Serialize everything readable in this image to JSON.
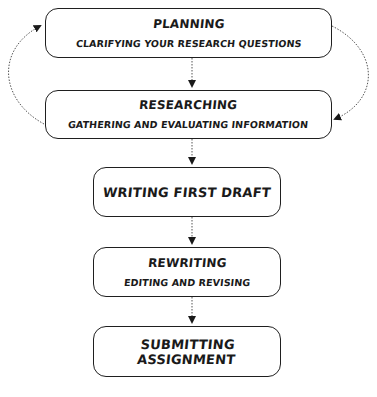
{
  "diagram": {
    "type": "flowchart",
    "steps": [
      {
        "id": "planning",
        "title": "PLANNING",
        "subtitle": "CLARIFYING YOUR RESEARCH QUESTIONS"
      },
      {
        "id": "researching",
        "title": "RESEARCHING",
        "subtitle": "GATHERING AND EVALUATING INFORMATION"
      },
      {
        "id": "writing",
        "title": "WRITING FIRST DRAFT"
      },
      {
        "id": "rewriting",
        "title": "REWRITING",
        "subtitle": "EDITING AND REVISING"
      },
      {
        "id": "submitting",
        "title": "SUBMITTING ASSIGNMENT"
      }
    ],
    "edges": [
      {
        "from": "planning",
        "to": "researching",
        "style": "dotted"
      },
      {
        "from": "planning",
        "to": "researching",
        "style": "dotted-curved-right"
      },
      {
        "from": "researching",
        "to": "planning",
        "style": "dotted-curved-left"
      },
      {
        "from": "researching",
        "to": "writing",
        "style": "dotted"
      },
      {
        "from": "writing",
        "to": "rewriting",
        "style": "dotted"
      },
      {
        "from": "rewriting",
        "to": "submitting",
        "style": "dotted"
      }
    ],
    "colors": {
      "stroke": "#1f1f1f",
      "background": "#ffffff",
      "connector": "#555555"
    }
  }
}
